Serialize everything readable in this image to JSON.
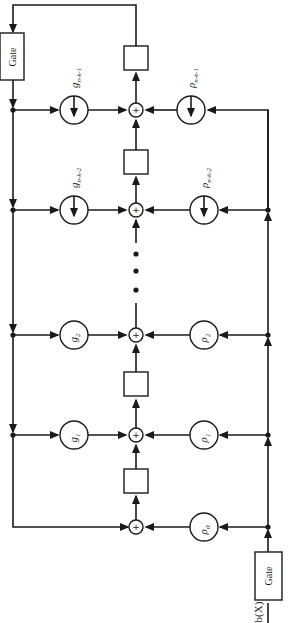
{
  "diagram": {
    "gate_top_label": "Gate",
    "gate_bottom_label": "Gate",
    "input_label": "b(X)",
    "adder_symbol": "+",
    "rows": [
      {
        "g_label": "g",
        "g_sub": "n-k-1",
        "rho_label": "ρ",
        "rho_sub": "n-k-1",
        "has_arrow_in": true
      },
      {
        "g_label": "g",
        "g_sub": "n-k-2",
        "rho_label": "ρ",
        "rho_sub": "n-k-2",
        "has_arrow_in": true
      },
      {
        "g_label": "g",
        "g_sub": "2",
        "rho_label": "ρ",
        "rho_sub": "2",
        "has_arrow_in": false
      },
      {
        "g_label": "g",
        "g_sub": "1",
        "rho_label": "ρ",
        "rho_sub": "1",
        "has_arrow_in": false
      },
      {
        "g_label": "",
        "g_sub": "",
        "rho_label": "ρ",
        "rho_sub": "0",
        "has_arrow_in": false
      }
    ],
    "ellipsis": "• • •"
  }
}
